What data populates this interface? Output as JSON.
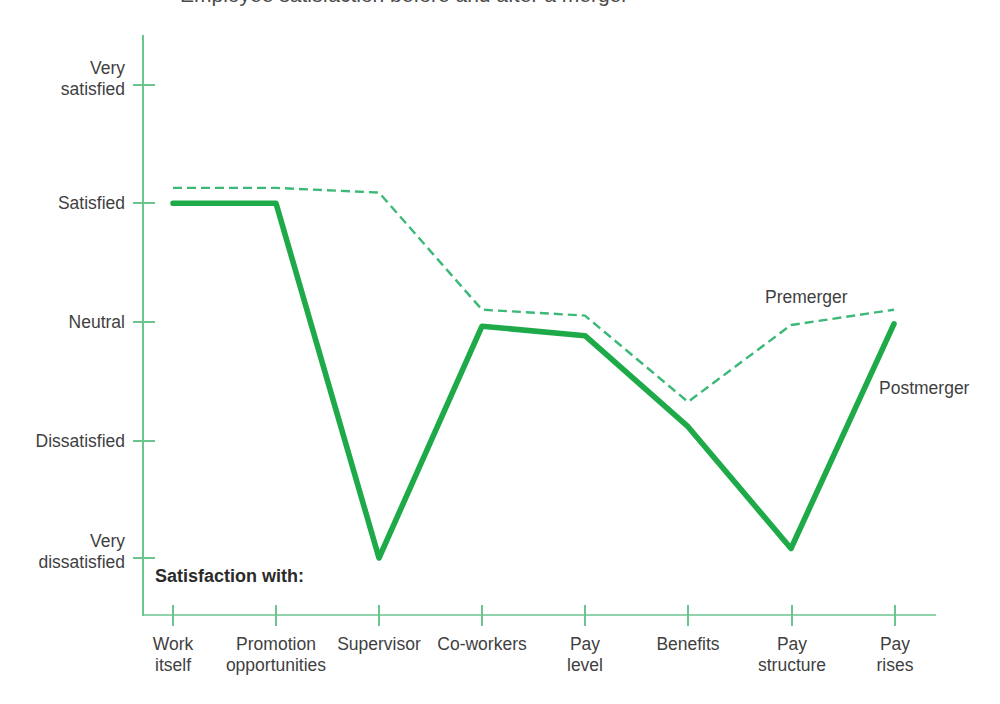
{
  "figure": {
    "title_clipped": "Employee satisfaction before and after a merger",
    "axis_caption": "Satisfaction with:",
    "accent_color": "#1faa4a",
    "dashed_color": "#3cb878",
    "axis_color": "#6cc48e",
    "text_color": "#3f3f3f"
  },
  "chart_data": {
    "type": "line",
    "title": "",
    "xlabel": "Satisfaction with:",
    "ylabel": "",
    "grid": false,
    "legend_position": "inline-annotation",
    "categories": [
      "Work itself",
      "Promotion opportunities",
      "Supervisor",
      "Co-workers",
      "Pay level",
      "Benefits",
      "Pay structure",
      "Pay rises"
    ],
    "category_lines": [
      [
        "Work",
        "itself"
      ],
      [
        "Promotion",
        "opportunities"
      ],
      [
        "Supervisor",
        ""
      ],
      [
        "Co-workers",
        ""
      ],
      [
        "Pay",
        "level"
      ],
      [
        "Benefits",
        ""
      ],
      [
        "Pay",
        "structure"
      ],
      [
        "Pay",
        "rises"
      ]
    ],
    "y_tick_labels": [
      [
        "Very",
        "satisfied"
      ],
      [
        "Satisfied",
        ""
      ],
      [
        "Neutral",
        ""
      ],
      [
        "Dissatisfied",
        ""
      ],
      [
        "Very",
        "dissatisfied"
      ]
    ],
    "y_scale": [
      {
        "label": "Very satisfied",
        "value": 5
      },
      {
        "label": "Satisfied",
        "value": 4
      },
      {
        "label": "Neutral",
        "value": 3
      },
      {
        "label": "Dissatisfied",
        "value": 2
      },
      {
        "label": "Very dissatisfied",
        "value": 1
      }
    ],
    "ylim": [
      1,
      5
    ],
    "series": [
      {
        "name": "Premerger",
        "style": "dashed",
        "color": "#3cb878",
        "values": [
          4.13,
          4.13,
          4.09,
          3.1,
          3.05,
          2.32,
          2.97,
          3.1
        ]
      },
      {
        "name": "Postmerger",
        "style": "solid",
        "color": "#1faa4a",
        "values": [
          4.0,
          4.0,
          1.0,
          2.96,
          2.88,
          2.11,
          1.08,
          2.98
        ]
      }
    ],
    "annotations": [
      {
        "text": "Premerger",
        "x_category": "Pay structure",
        "align": "above-dashed"
      },
      {
        "text": "Postmerger",
        "x_category": "Pay rises",
        "align": "right-of-solid"
      }
    ]
  }
}
